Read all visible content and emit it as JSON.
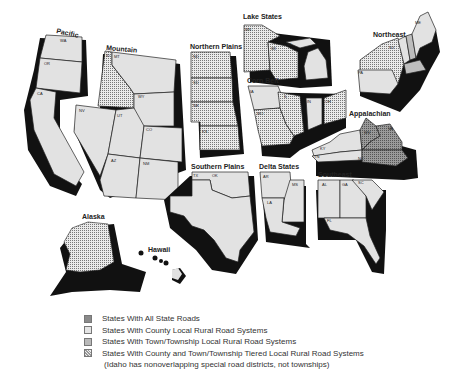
{
  "map": {
    "colors": {
      "all_state": "#8a8a8a",
      "county": "#e2e2e2",
      "town": "#bdbdbd",
      "tiered": "#cfcfcf",
      "shadow": "#111111",
      "border": "#222222"
    },
    "regions": [
      {
        "name": "Pacific",
        "states": [
          "WA",
          "OR",
          "CA"
        ]
      },
      {
        "name": "Mountain",
        "states": [
          "ID",
          "MT",
          "WY",
          "NV",
          "UT",
          "CO",
          "AZ",
          "NM"
        ]
      },
      {
        "name": "Northern Plains",
        "states": [
          "ND",
          "SD",
          "NE",
          "KS"
        ]
      },
      {
        "name": "Southern Plains",
        "states": [
          "OK",
          "TX"
        ]
      },
      {
        "name": "Lake States",
        "states": [
          "MN",
          "WI",
          "MI"
        ]
      },
      {
        "name": "Corn Belt",
        "states": [
          "IA",
          "IL",
          "IN",
          "OH",
          "MO"
        ]
      },
      {
        "name": "Northeast",
        "states": [
          "ME",
          "NY",
          "PA"
        ]
      },
      {
        "name": "Appalachian",
        "states": [
          "WV",
          "VA",
          "KY",
          "TN",
          "NC"
        ]
      },
      {
        "name": "Delta States",
        "states": [
          "AR",
          "MS",
          "LA"
        ]
      },
      {
        "name": "Southeast",
        "states": [
          "AL",
          "GA",
          "SC",
          "FL"
        ]
      },
      {
        "name": "Alaska",
        "states": []
      },
      {
        "name": "Hawaii",
        "states": []
      }
    ]
  },
  "legend": {
    "items": [
      {
        "key": "all_state",
        "label": "States With All State Roads"
      },
      {
        "key": "county",
        "label": "States With County Local Rural Road Systems"
      },
      {
        "key": "town",
        "label": "States With Town/Township Local Rural Road Systems"
      },
      {
        "key": "tiered",
        "label": "States With County and Town/Township Tiered Local Rural Road Systems"
      }
    ],
    "note": "(Idaho has nonoverlapping special road districts, not townships)"
  }
}
